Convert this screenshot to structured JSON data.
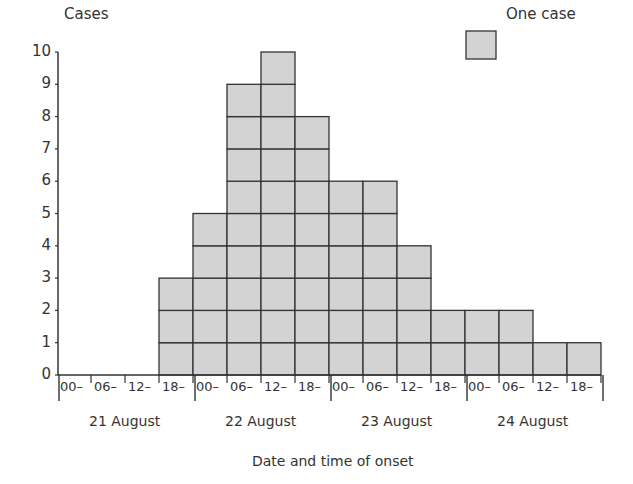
{
  "chart_data": {
    "type": "bar",
    "subtype": "epidemic-curve-histogram",
    "title": "",
    "ylabel": "Cases",
    "xlabel": "Date and time of onset",
    "ylim": [
      0,
      10
    ],
    "yticks": [
      0,
      1,
      2,
      3,
      4,
      5,
      6,
      7,
      8,
      9,
      10
    ],
    "grid": false,
    "legend": {
      "position": "top-right",
      "entries": [
        {
          "label": "One case",
          "color": "#d3d3d3"
        }
      ]
    },
    "days": [
      "21 August",
      "22 August",
      "23 August",
      "24 August"
    ],
    "time_bins": [
      "00–",
      "06–",
      "12–",
      "18–"
    ],
    "categories": [
      "21 Aug 00–",
      "21 Aug 06–",
      "21 Aug 12–",
      "21 Aug 18–",
      "22 Aug 00–",
      "22 Aug 06–",
      "22 Aug 12–",
      "22 Aug 18–",
      "23 Aug 00–",
      "23 Aug 06–",
      "23 Aug 12–",
      "23 Aug 18–",
      "24 Aug 00–",
      "24 Aug 06–",
      "24 Aug 12–",
      "24 Aug 18–"
    ],
    "values": [
      0,
      0,
      0,
      3,
      5,
      9,
      10,
      8,
      6,
      6,
      4,
      2,
      2,
      2,
      1,
      1
    ],
    "colors": {
      "box_fill": "#d3d3d3",
      "box_stroke": "#333333",
      "axis": "#333333"
    }
  },
  "labels": {
    "ylabel": "Cases",
    "xlabel": "Date and time of onset",
    "legend": "One case"
  }
}
